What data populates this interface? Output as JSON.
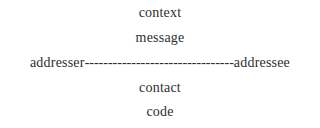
{
  "diagram": {
    "title": "",
    "nodes": {
      "context": "context",
      "message": "message",
      "addresser": "addresser",
      "connector": "--------------------------------",
      "addressee": "addressee",
      "contact": "contact",
      "code": "code"
    },
    "colors": {
      "text": "#2e2e2e",
      "background": "#ffffff"
    }
  }
}
